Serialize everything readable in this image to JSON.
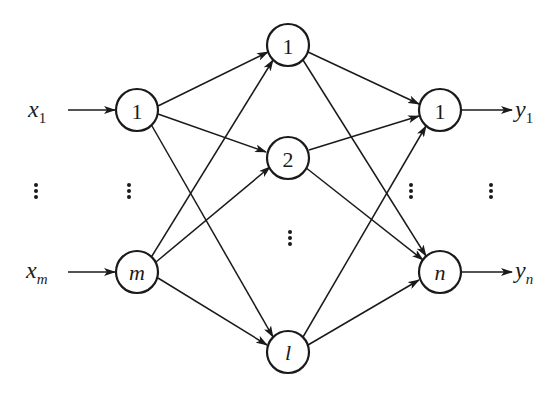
{
  "diagram": {
    "type": "feedforward-neural-network",
    "colors": {
      "stroke": "#1a1a1a",
      "background": "#ffffff"
    },
    "inputs": [
      {
        "var": "x",
        "sub": "1"
      },
      {
        "var": "x",
        "sub": "m"
      }
    ],
    "outputs": [
      {
        "var": "y",
        "sub": "1"
      },
      {
        "var": "y",
        "sub": "n"
      }
    ],
    "layers": {
      "input": [
        {
          "label": "1"
        },
        {
          "label": "m"
        }
      ],
      "hidden": [
        {
          "label": "1"
        },
        {
          "label": "2"
        },
        {
          "label": "l"
        }
      ],
      "output": [
        {
          "label": "1"
        },
        {
          "label": "n"
        }
      ]
    },
    "ellipsis": "⋮"
  }
}
